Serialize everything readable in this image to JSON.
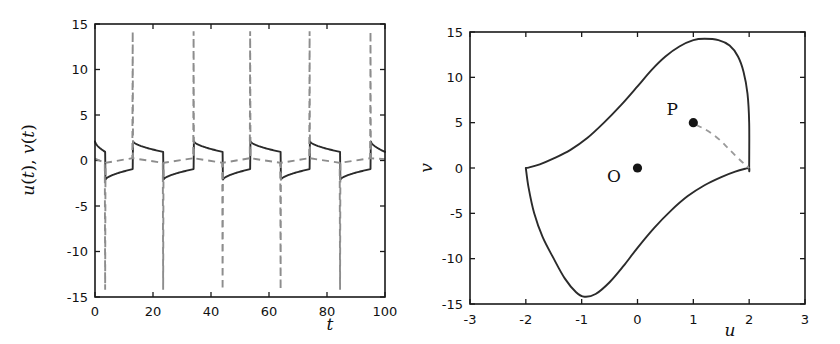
{
  "figure": {
    "name": "two-panel-relaxation-oscillator-figure",
    "background": "#ffffff",
    "line_color_solid": "#2b2b2b",
    "line_color_dashed": "#8d8d8d"
  },
  "chart_data": [
    {
      "type": "line",
      "id": "time-series",
      "title": "",
      "xlabel": "t",
      "ylabel": "u(t), v(t)",
      "ylabel_parts": [
        "u",
        "(",
        "t",
        ")",
        ", ",
        "v",
        "(",
        "t",
        ")"
      ],
      "xlim": [
        0,
        100
      ],
      "ylim": [
        -15,
        15
      ],
      "xticks": [
        0,
        20,
        40,
        60,
        80,
        100
      ],
      "xticklabels": [
        "0",
        "20",
        "40",
        "60",
        "80",
        "100"
      ],
      "yticks": [
        15,
        10,
        5,
        0,
        -5,
        -10,
        -15
      ],
      "yticklabels": [
        "15",
        "10",
        "5",
        "0",
        "-5",
        "-10",
        "-15"
      ],
      "grid": false,
      "legend": null,
      "series": [
        {
          "name": "u(t)",
          "style": "solid",
          "color": "#2b2b2b",
          "description": "relaxation oscillation, square-like wave alternating between about +2 and -2 with slow decay on each plateau",
          "period": 20.0,
          "plateau_high": 2.1,
          "plateau_low": -2.1,
          "switch_down_times": [
            3.5,
            23.5,
            44.0,
            64.0,
            84.5
          ],
          "switch_up_times": [
            13.0,
            34.0,
            53.5,
            74.0,
            95.0
          ]
        },
        {
          "name": "v(t)",
          "style": "dashed",
          "color": "#8d8d8d",
          "description": "slow variable near zero with narrow vertical spikes at each switching instant; upward spikes exceed +14 and downward spikes fall below -14",
          "baseline": 0.0,
          "spike_up_times": [
            13.0,
            34.0,
            53.5,
            74.0,
            95.0
          ],
          "spike_up_peak": 14.2,
          "spike_down_times": [
            3.5,
            23.5,
            44.0,
            64.0,
            84.5
          ],
          "spike_down_peak": -14.2
        }
      ]
    },
    {
      "type": "line",
      "id": "phase-portrait",
      "title": "",
      "xlabel": "u",
      "ylabel": "v",
      "xlim": [
        -3,
        3
      ],
      "ylim": [
        -15,
        15
      ],
      "xticks": [
        -3,
        -2,
        -1,
        0,
        1,
        2,
        3
      ],
      "xticklabels": [
        "-3",
        "-2",
        "-1",
        "0",
        "1",
        "2",
        "3"
      ],
      "yticks": [
        15,
        10,
        5,
        0,
        -5,
        -10,
        -15
      ],
      "yticklabels": [
        "15",
        "10",
        "5",
        "0",
        "-5",
        "-10",
        "-15"
      ],
      "grid": false,
      "legend": null,
      "series": [
        {
          "name": "limit cycle",
          "style": "solid",
          "color": "#2b2b2b",
          "closed": true,
          "points": [
            [
              -2.0,
              0.0
            ],
            [
              -1.95,
              -2.2
            ],
            [
              -1.85,
              -5.0
            ],
            [
              -1.7,
              -7.6
            ],
            [
              -1.5,
              -10.0
            ],
            [
              -1.3,
              -12.2
            ],
            [
              -1.1,
              -13.7
            ],
            [
              -0.95,
              -14.2
            ],
            [
              -0.75,
              -13.9
            ],
            [
              -0.5,
              -12.6
            ],
            [
              -0.25,
              -10.8
            ],
            [
              0.0,
              -8.8
            ],
            [
              0.3,
              -6.6
            ],
            [
              0.6,
              -4.7
            ],
            [
              0.9,
              -3.1
            ],
            [
              1.2,
              -1.9
            ],
            [
              1.5,
              -1.0
            ],
            [
              1.75,
              -0.4
            ],
            [
              1.95,
              -0.05
            ],
            [
              2.0,
              0.0
            ],
            [
              2.0,
              0.0
            ],
            [
              2.0,
              5.0
            ],
            [
              1.97,
              8.2
            ],
            [
              1.9,
              10.6
            ],
            [
              1.8,
              12.3
            ],
            [
              1.65,
              13.5
            ],
            [
              1.45,
              14.1
            ],
            [
              1.2,
              14.25
            ],
            [
              1.0,
              14.1
            ],
            [
              0.75,
              13.4
            ],
            [
              0.5,
              12.3
            ],
            [
              0.25,
              10.8
            ],
            [
              0.0,
              9.0
            ],
            [
              -0.3,
              6.9
            ],
            [
              -0.6,
              5.0
            ],
            [
              -0.9,
              3.3
            ],
            [
              -1.2,
              2.0
            ],
            [
              -1.5,
              1.05
            ],
            [
              -1.75,
              0.4
            ],
            [
              -1.95,
              0.05
            ],
            [
              -2.0,
              0.0
            ]
          ]
        },
        {
          "name": "transient trajectory from P",
          "style": "dashed",
          "color": "#9a9a9a",
          "closed": false,
          "points": [
            [
              1.05,
              4.75
            ],
            [
              1.2,
              4.3
            ],
            [
              1.35,
              3.7
            ],
            [
              1.5,
              2.95
            ],
            [
              1.62,
              2.2
            ],
            [
              1.74,
              1.45
            ],
            [
              1.85,
              0.8
            ],
            [
              1.94,
              0.3
            ],
            [
              2.0,
              0.0
            ]
          ]
        }
      ],
      "annotations": [
        {
          "label": "O",
          "x": 0.0,
          "y": 0.0,
          "label_dx": -0.42,
          "label_dy": -1.0,
          "marker": "filled-circle"
        },
        {
          "label": "P",
          "x": 1.0,
          "y": 5.0,
          "label_dx": -0.38,
          "label_dy": 1.4,
          "marker": "filled-circle"
        }
      ]
    }
  ]
}
